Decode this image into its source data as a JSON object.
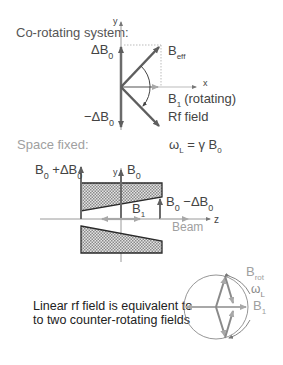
{
  "colors": {
    "background": "#ffffff",
    "dark_arrow": "#6b6b6b",
    "light_arrow": "#a8a8a8",
    "axis": "#9a9a9a",
    "text_dark": "#3a3a3a",
    "text_light": "#9a9a9a",
    "hatch_fill": "#cfcfcf",
    "outline": "#2a2a2a"
  },
  "corotating": {
    "heading": "Co-rotating system:",
    "y_axis_label": "y",
    "x_axis_label": "x",
    "delta_b0": {
      "main": "ΔB",
      "sub": "0"
    },
    "minus_delta_b0": {
      "main": "−ΔB",
      "sub": "0"
    },
    "b_eff": {
      "main": "B",
      "sub": "eff"
    },
    "b1_rotating": {
      "main": "B",
      "sub": "1",
      "suffix": "(rotating)"
    },
    "rf_field": "Rf field"
  },
  "space_fixed": {
    "heading": "Space fixed:",
    "larmor": {
      "omega": "ω",
      "omega_sub": "L",
      "rest": " = γ B",
      "b_sub": "0"
    },
    "y_axis_label": "y",
    "z_axis_label": "z",
    "b0_plus": {
      "b": "B",
      "b_sub": "0",
      "mid": " +ΔB",
      "end_sub": "0"
    },
    "b0": {
      "main": "B",
      "sub": "0"
    },
    "b0_minus": {
      "b": "B",
      "b_sub": "0",
      "mid": " −ΔB",
      "end_sub": "0"
    },
    "b1": {
      "main": "B",
      "sub": "1"
    },
    "beam": "Beam"
  },
  "counter_rotating": {
    "caption_line1": "Linear rf field is equivalent to",
    "caption_line2": "to two counter-rotating fields",
    "b_rot": {
      "main": "B",
      "sub": "rot"
    },
    "omega_l": {
      "main": "ω",
      "sub": "L"
    },
    "b1": {
      "main": "B",
      "sub": "1"
    }
  }
}
